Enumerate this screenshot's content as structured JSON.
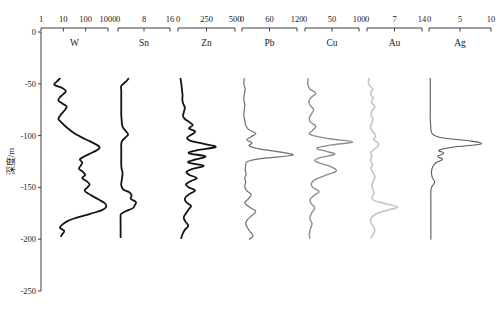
{
  "figure": {
    "y_axis": {
      "label": "深度/m",
      "ticks": [
        0,
        -50,
        -100,
        -150,
        -200,
        -250
      ],
      "tick_labels": [
        "0",
        "-50",
        "-100",
        "-150",
        "-200",
        "-250"
      ],
      "range": [
        0,
        -250
      ]
    }
  },
  "chart_data": {
    "type": "line",
    "title": "",
    "xlabel": "",
    "ylabel": "深度/m",
    "ylim": [
      -250,
      0
    ],
    "grid": false,
    "legend_position": "none",
    "orientation": "vertical-depth-profile",
    "panel_count": 7,
    "shared_y": {
      "name": "Depth",
      "unit": "m",
      "ticks": [
        0,
        -50,
        -100,
        -150,
        -200,
        -250
      ],
      "range": [
        0,
        -250
      ]
    },
    "panels": [
      {
        "name": "W",
        "label": "W",
        "scale": "log",
        "xlim": [
          1,
          1000
        ],
        "xticks": [
          1,
          10,
          100,
          1000
        ],
        "xtick_labels": [
          "1",
          "10",
          "100",
          "1000"
        ],
        "color": "#141414",
        "line_width": 1.8,
        "depths": [
          -45,
          -48,
          -51,
          -54,
          -57,
          -60,
          -63,
          -66,
          -69,
          -72,
          -75,
          -78,
          -81,
          -84,
          -87,
          -90,
          -93,
          -96,
          -99,
          -102,
          -105,
          -108,
          -111,
          -114,
          -117,
          -120,
          -123,
          -126,
          -129,
          -132,
          -135,
          -138,
          -141,
          -144,
          -147,
          -150,
          -153,
          -156,
          -159,
          -162,
          -165,
          -168,
          -171,
          -174,
          -177,
          -180,
          -183,
          -186,
          -189,
          -192,
          -195,
          -197
        ],
        "values": [
          7,
          5,
          4,
          9,
          13,
          10,
          7,
          6,
          9,
          14,
          12,
          9,
          7,
          6,
          8,
          11,
          16,
          24,
          38,
          70,
          140,
          260,
          420,
          330,
          170,
          90,
          55,
          70,
          60,
          50,
          75,
          95,
          70,
          110,
          150,
          120,
          90,
          130,
          230,
          400,
          700,
          850,
          640,
          280,
          90,
          30,
          14,
          9,
          7,
          11,
          9,
          8
        ]
      },
      {
        "name": "Sn",
        "label": "Sn",
        "scale": "linear",
        "xlim": [
          0,
          16
        ],
        "xticks": [
          0,
          8,
          16
        ],
        "xtick_labels": [
          "0",
          "8",
          "16"
        ],
        "color": "#141414",
        "line_width": 1.8,
        "depths": [
          -45,
          -48,
          -52,
          -56,
          -60,
          -64,
          -68,
          -72,
          -76,
          -80,
          -84,
          -88,
          -92,
          -96,
          -99,
          -102,
          -105,
          -108,
          -112,
          -116,
          -120,
          -124,
          -128,
          -132,
          -136,
          -140,
          -144,
          -148,
          -152,
          -155,
          -158,
          -161,
          -164,
          -167,
          -170,
          -173,
          -176,
          -180,
          -185,
          -190,
          -195,
          -198
        ],
        "values": [
          3.2,
          2.4,
          1.0,
          1.0,
          1.0,
          1.0,
          1.0,
          1.0,
          1.0,
          1.0,
          1.1,
          1.2,
          1.5,
          2.5,
          3.1,
          2.2,
          1.3,
          1.0,
          1.0,
          1.0,
          1.0,
          1.0,
          1.0,
          1.1,
          1.4,
          1.3,
          1.1,
          1.0,
          1.6,
          3.6,
          4.2,
          3.9,
          5.5,
          5.2,
          4.6,
          2.4,
          0.9,
          0.8,
          0.8,
          0.8,
          0.8,
          0.8
        ]
      },
      {
        "name": "Zn",
        "label": "Zn",
        "scale": "linear",
        "xlim": [
          0,
          500
        ],
        "xticks": [
          0,
          250,
          500
        ],
        "xtick_labels": [
          "0",
          "250",
          "500"
        ],
        "color": "#141414",
        "line_width": 1.8,
        "depths": [
          -45,
          -49,
          -53,
          -57,
          -61,
          -65,
          -69,
          -73,
          -77,
          -81,
          -84,
          -87,
          -90,
          -93,
          -96,
          -99,
          -102,
          -105,
          -108,
          -111,
          -114,
          -117,
          -120,
          -123,
          -126,
          -129,
          -132,
          -135,
          -138,
          -141,
          -144,
          -147,
          -150,
          -153,
          -156,
          -159,
          -162,
          -165,
          -168,
          -171,
          -175,
          -179,
          -183,
          -187,
          -191,
          -195,
          -199
        ],
        "values": [
          22,
          28,
          32,
          36,
          40,
          38,
          45,
          60,
          52,
          44,
          60,
          100,
          130,
          95,
          150,
          120,
          80,
          110,
          230,
          330,
          170,
          95,
          240,
          155,
          90,
          225,
          130,
          75,
          100,
          165,
          110,
          70,
          95,
          150,
          105,
          70,
          60,
          80,
          115,
          95,
          70,
          50,
          65,
          90,
          60,
          40,
          28
        ]
      },
      {
        "name": "Pb",
        "label": "Pb",
        "scale": "linear",
        "xlim": [
          0,
          120
        ],
        "xticks": [
          0,
          60,
          120
        ],
        "xtick_labels": [
          "0",
          "60",
          "120"
        ],
        "color": "#6e6e6e",
        "line_width": 1.2,
        "depths": [
          -45,
          -50,
          -55,
          -60,
          -65,
          -70,
          -75,
          -80,
          -85,
          -90,
          -94,
          -98,
          -101,
          -104,
          -107,
          -110,
          -113,
          -116,
          -119,
          -122,
          -125,
          -129,
          -133,
          -137,
          -141,
          -145,
          -149,
          -153,
          -157,
          -161,
          -165,
          -169,
          -173,
          -177,
          -181,
          -185,
          -189,
          -193,
          -197,
          -200
        ],
        "values": [
          5,
          4,
          7,
          5,
          4,
          6,
          5,
          4,
          6,
          8,
          14,
          30,
          20,
          10,
          22,
          16,
          40,
          85,
          110,
          45,
          12,
          8,
          7,
          9,
          6,
          8,
          6,
          10,
          20,
          14,
          6,
          16,
          30,
          22,
          12,
          8,
          12,
          18,
          24,
          16
        ]
      },
      {
        "name": "Cu",
        "label": "Cu",
        "scale": "linear",
        "xlim": [
          0,
          100
        ],
        "xticks": [
          0,
          50,
          100
        ],
        "xtick_labels": [
          "0",
          "50",
          "100"
        ],
        "color": "#8c8c8c",
        "line_width": 1.4,
        "depths": [
          -45,
          -50,
          -55,
          -59,
          -63,
          -67,
          -71,
          -75,
          -79,
          -83,
          -87,
          -91,
          -95,
          -99,
          -103,
          -106,
          -109,
          -112,
          -115,
          -118,
          -121,
          -124,
          -127,
          -130,
          -134,
          -138,
          -142,
          -146,
          -150,
          -154,
          -158,
          -162,
          -166,
          -170,
          -175,
          -180,
          -185,
          -190,
          -195,
          -199
        ],
        "values": [
          6,
          5,
          9,
          20,
          12,
          7,
          10,
          16,
          12,
          8,
          10,
          20,
          14,
          10,
          45,
          88,
          50,
          22,
          38,
          55,
          30,
          18,
          30,
          48,
          58,
          40,
          20,
          12,
          14,
          26,
          16,
          9,
          12,
          18,
          12,
          9,
          13,
          10,
          8,
          9
        ]
      },
      {
        "name": "Au",
        "label": "Au",
        "scale": "linear",
        "xlim": [
          0,
          14
        ],
        "xticks": [
          0,
          7,
          14
        ],
        "xtick_labels": [
          "0",
          "7",
          "14"
        ],
        "color": "#c4c4c4",
        "line_width": 1.6,
        "depths": [
          -45,
          -50,
          -55,
          -60,
          -64,
          -68,
          -72,
          -76,
          -80,
          -84,
          -88,
          -92,
          -96,
          -100,
          -104,
          -108,
          -112,
          -116,
          -120,
          -124,
          -128,
          -132,
          -136,
          -140,
          -144,
          -148,
          -152,
          -156,
          -160,
          -163,
          -166,
          -169,
          -172,
          -175,
          -179,
          -183,
          -187,
          -191,
          -195,
          -199
        ],
        "values": [
          0.5,
          0.4,
          1.4,
          0.9,
          1.6,
          1.1,
          2.0,
          1.3,
          1.0,
          1.5,
          1.2,
          0.9,
          1.4,
          2.2,
          1.8,
          3.0,
          2.3,
          1.0,
          1.2,
          0.9,
          1.4,
          1.0,
          1.6,
          2.0,
          1.6,
          1.2,
          1.5,
          1.8,
          1.2,
          2.0,
          5.0,
          7.8,
          5.2,
          2.6,
          1.2,
          0.9,
          1.5,
          2.0,
          1.6,
          1.0
        ]
      },
      {
        "name": "Ag",
        "label": "Ag",
        "scale": "linear",
        "xlim": [
          0,
          10
        ],
        "xticks": [
          0,
          5,
          10
        ],
        "xtick_labels": [
          "0",
          "5",
          "10"
        ],
        "color": "#5a5a5a",
        "line_width": 1.1,
        "depths": [
          -45,
          -55,
          -65,
          -75,
          -85,
          -92,
          -98,
          -102,
          -105,
          -108,
          -111,
          -114,
          -117,
          -120,
          -123,
          -126,
          -130,
          -135,
          -140,
          -145,
          -150,
          -155,
          -160,
          -170,
          -180,
          -190,
          -200
        ],
        "values": [
          0.2,
          0.2,
          0.2,
          0.2,
          0.2,
          0.3,
          0.5,
          2.0,
          6.5,
          8.4,
          4.0,
          1.6,
          2.4,
          1.4,
          2.2,
          1.2,
          0.6,
          0.4,
          0.5,
          0.9,
          0.4,
          0.3,
          0.3,
          0.3,
          0.3,
          0.3,
          0.3
        ]
      }
    ]
  }
}
